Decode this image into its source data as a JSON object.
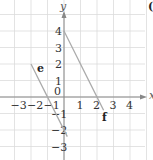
{
  "diagram": {
    "type": "coordinate-plane",
    "axes": {
      "x_label": "x",
      "y_label": "y",
      "x_ticks": [
        "−3",
        "−2",
        "−1",
        "1",
        "2",
        "3",
        "4"
      ],
      "y_ticks": [
        "4",
        "3",
        "2",
        "1",
        "−1",
        "−2",
        "−3"
      ],
      "origin_label": "0",
      "x_range": [
        -3.8,
        4.8
      ],
      "y_range": [
        -3.8,
        5
      ]
    },
    "lines": [
      {
        "name": "e",
        "equation": "y = -2x - 2",
        "from": [
          -2,
          2
        ],
        "to": [
          0.2,
          -2.4
        ]
      },
      {
        "name": "f",
        "equation": "y = -2x + 4",
        "from": [
          0,
          4
        ],
        "to": [
          2.4,
          -0.8
        ]
      }
    ],
    "colors": {
      "grid": "#dcdcdc",
      "axis": "#888888",
      "lines": "#aaaaaa",
      "text": "#333333"
    },
    "partial_label": "("
  }
}
